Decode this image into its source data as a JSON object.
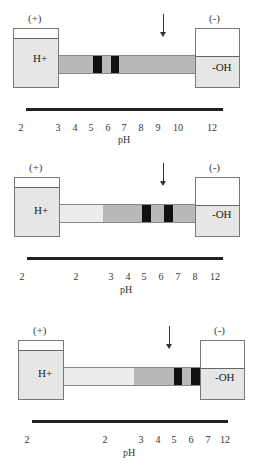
{
  "panels": [
    {
      "anode_label": "(+)",
      "cathode_label": "(-)",
      "anode_solution": "H+",
      "cathode_solution": "-OH",
      "axis_label": "pH",
      "ticks": [
        "2",
        "3",
        "4",
        "5",
        "6",
        "7",
        "8",
        "9",
        "10",
        "12"
      ],
      "description": "Initial focusing: two bands near pH 5-6.5, sample applied near pH 9"
    },
    {
      "anode_label": "(+)",
      "cathode_label": "(-)",
      "anode_solution": "H+",
      "cathode_solution": "-OH",
      "axis_label": "pH",
      "ticks": [
        "2",
        "2",
        "3",
        "4",
        "5",
        "6",
        "7",
        "8",
        "12"
      ],
      "description": "Narrowed gradient: bands near pH 5 and 6.5"
    },
    {
      "anode_label": "(+)",
      "cathode_label": "(-)",
      "anode_solution": "H+",
      "cathode_solution": "-OH",
      "axis_label": "pH",
      "ticks": [
        "2",
        "2",
        "3",
        "4",
        "5",
        "6",
        "7",
        "12"
      ],
      "description": "Further narrowed gradient: bands near pH 5 and 6.5"
    }
  ],
  "colors": {
    "band": "#111111",
    "gradient": "#b8b8b8",
    "reservoir": "#e6e6e6",
    "axis": "#222222"
  }
}
